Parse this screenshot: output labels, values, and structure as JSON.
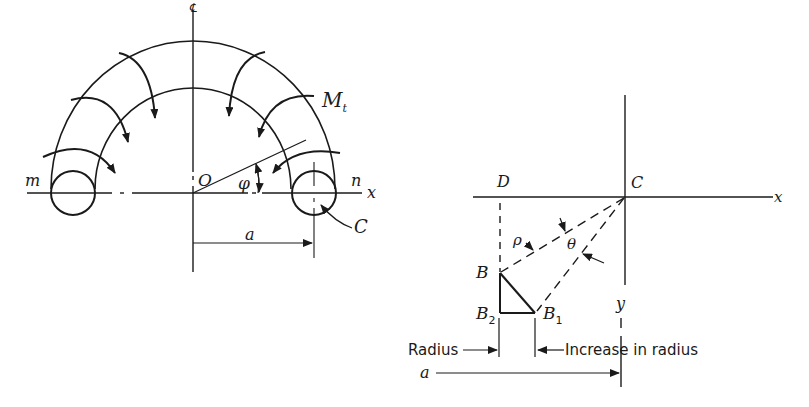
{
  "left_figure": {
    "labels": {
      "moment": "M",
      "moment_sub": "t",
      "end_m": "m",
      "end_n": "n",
      "origin": "O",
      "angle": "φ",
      "x_axis": "x",
      "center": "C",
      "dimension": "a",
      "centerline": "℄"
    }
  },
  "right_figure": {
    "labels": {
      "point_D": "D",
      "point_C": "C",
      "x_axis": "x",
      "y_axis": "y",
      "rho": "ρ",
      "theta": "θ",
      "point_B": "B",
      "point_B2": "B",
      "point_B2_sub": "2",
      "point_B1": "B",
      "point_B1_sub": "1",
      "radius": "Radius",
      "increase_in_radius": "Increase in radius",
      "dimension": "a"
    }
  },
  "colors": {
    "ink": "#1a1a1a",
    "background": "#ffffff"
  }
}
